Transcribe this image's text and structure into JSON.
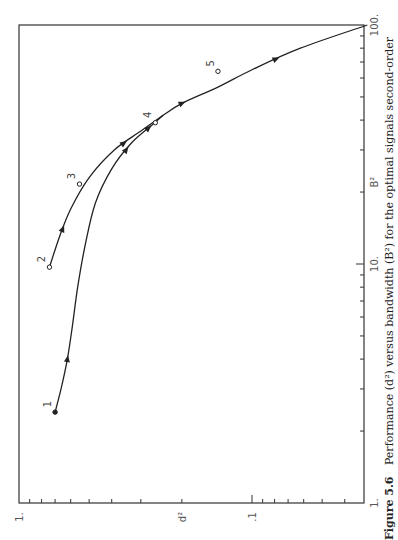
{
  "chart_data": {
    "type": "line",
    "orientation": "rotated-90-ccw",
    "title": "",
    "caption": {
      "label": "Figure 5.6",
      "text": "Performance (d²) versus bandwidth (B²) for the optimal signals second-order"
    },
    "xlabel": "B²",
    "ylabel": "d²",
    "x_scale": "log",
    "y_scale": "log",
    "xlim": [
      1,
      100
    ],
    "ylim": [
      0.03,
      1
    ],
    "x_ticks": [
      {
        "value": 1,
        "label": "1."
      },
      {
        "value": 10,
        "label": "10."
      },
      {
        "value": 100,
        "label": "100."
      }
    ],
    "y_ticks": [
      {
        "value": 1,
        "label": "1."
      },
      {
        "value": 0.1,
        "label": ".1"
      }
    ],
    "points": [
      {
        "id": "1",
        "B2": 2.4,
        "d2": 0.7,
        "marker": "filled"
      },
      {
        "id": "2",
        "B2": 9.7,
        "d2": 0.74,
        "marker": "open"
      },
      {
        "id": "3",
        "B2": 21.6,
        "d2": 0.55,
        "marker": "open"
      },
      {
        "id": "4",
        "B2": 39,
        "d2": 0.26,
        "marker": "open"
      },
      {
        "id": "5",
        "B2": 64,
        "d2": 0.14,
        "marker": "open"
      }
    ],
    "series": [
      {
        "name": "trajectory from point 1",
        "B2": [
          2.4,
          3.0,
          4.0,
          5.5,
          8.0,
          12.0,
          18.0,
          25.0,
          32.0,
          38.0,
          42.0
        ],
        "d2": [
          0.7,
          0.66,
          0.62,
          0.59,
          0.56,
          0.52,
          0.47,
          0.4,
          0.33,
          0.27,
          0.24
        ],
        "arrows_at_B2": [
          4.0,
          30.0,
          37.0
        ]
      },
      {
        "name": "trajectory from point 2",
        "B2": [
          9.7,
          13.0,
          17.0,
          23.0,
          30.0,
          36.0,
          42.0
        ],
        "d2": [
          0.74,
          0.67,
          0.6,
          0.5,
          0.39,
          0.3,
          0.24
        ],
        "arrows_at_B2": [
          14.0,
          32.0
        ]
      },
      {
        "name": "common trajectory",
        "B2": [
          42.0,
          47.0,
          55.0,
          65.0,
          80.0,
          100.0
        ],
        "d2": [
          0.24,
          0.2,
          0.14,
          0.1,
          0.062,
          0.032
        ],
        "arrows_at_B2": [
          47.0,
          72.0
        ]
      }
    ],
    "grid": false,
    "legend": "none"
  }
}
